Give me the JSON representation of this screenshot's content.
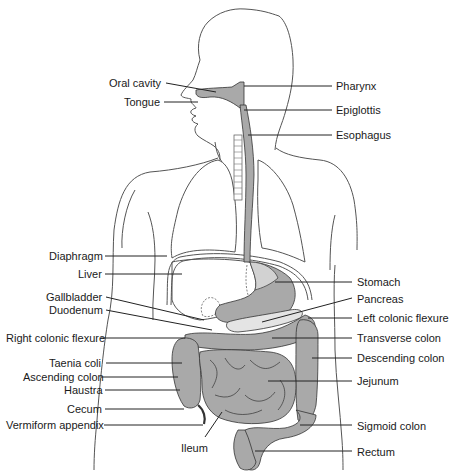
{
  "diagram": {
    "colors": {
      "background": "#ffffff",
      "outline": "#555555",
      "organ_fill": "#a9a9a9",
      "organ_light_fill": "#d2d2d2",
      "text": "#1a1a1a"
    },
    "labels_left": [
      {
        "id": "oral-cavity",
        "text": "Oral cavity",
        "x": 109,
        "y": 77
      },
      {
        "id": "tongue",
        "text": "Tongue",
        "x": 124,
        "y": 96
      },
      {
        "id": "diaphragm",
        "text": "Diaphragm",
        "x": 49,
        "y": 250
      },
      {
        "id": "liver",
        "text": "Liver",
        "x": 78,
        "y": 268
      },
      {
        "id": "gallbladder",
        "text": "Gallbladder",
        "x": 46,
        "y": 291
      },
      {
        "id": "duodenum",
        "text": "Duodenum",
        "x": 49,
        "y": 304
      },
      {
        "id": "right-colonic-flexure",
        "text": "Right colonic flexure",
        "x": 6,
        "y": 332
      },
      {
        "id": "taenia-coli",
        "text": "Taenia coli",
        "x": 49,
        "y": 357
      },
      {
        "id": "ascending-colon",
        "text": "Ascending colon",
        "x": 23,
        "y": 371
      },
      {
        "id": "haustra",
        "text": "Haustra",
        "x": 64,
        "y": 384
      },
      {
        "id": "cecum",
        "text": "Cecum",
        "x": 67,
        "y": 403
      },
      {
        "id": "vermiform-appendix",
        "text": "Vermiform appendix",
        "x": 6,
        "y": 419
      }
    ],
    "labels_right": [
      {
        "id": "pharynx",
        "text": "Pharynx",
        "x": 336,
        "y": 80
      },
      {
        "id": "epiglottis",
        "text": "Epiglottis",
        "x": 336,
        "y": 104
      },
      {
        "id": "esophagus",
        "text": "Esophagus",
        "x": 336,
        "y": 129
      },
      {
        "id": "stomach",
        "text": "Stomach",
        "x": 357,
        "y": 276
      },
      {
        "id": "pancreas",
        "text": "Pancreas",
        "x": 357,
        "y": 293
      },
      {
        "id": "left-colonic-flexure",
        "text": "Left colonic flexure",
        "x": 357,
        "y": 312
      },
      {
        "id": "transverse-colon",
        "text": "Transverse colon",
        "x": 357,
        "y": 332
      },
      {
        "id": "descending-colon",
        "text": "Descending colon",
        "x": 357,
        "y": 352
      },
      {
        "id": "jejunum",
        "text": "Jejunum",
        "x": 357,
        "y": 375
      },
      {
        "id": "sigmoid-colon",
        "text": "Sigmoid colon",
        "x": 357,
        "y": 420
      },
      {
        "id": "rectum",
        "text": "Rectum",
        "x": 357,
        "y": 446
      }
    ],
    "labels_bottom": [
      {
        "id": "ileum",
        "text": "Ileum",
        "x": 181,
        "y": 442
      }
    ]
  }
}
